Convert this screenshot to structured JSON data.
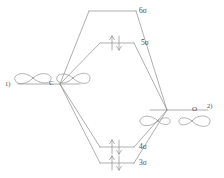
{
  "diagram": {
    "type": "molecular-orbital-correlation-diagram",
    "stroke_color": "#8c8c8c",
    "text_color": "#4a4a4a",
    "background_color": "#ffffff",
    "left_fragment": {
      "index_label": "1)",
      "atom_label": "C",
      "orbitals": [
        "p-orbital-lobe-outer",
        "p-orbital-lobe-inner"
      ]
    },
    "right_fragment": {
      "index_label": "2)",
      "atom_label": "O",
      "orbitals": [
        "p-orbital-lobe-inner",
        "p-orbital-lobe-outer"
      ]
    },
    "mo_levels": [
      {
        "label": "6σ",
        "electrons": 0,
        "occupancy": "empty"
      },
      {
        "label": "5σ",
        "electrons": 2,
        "occupancy": "paired"
      },
      {
        "label": "4σ",
        "electrons": 2,
        "occupancy": "paired"
      },
      {
        "label": "3σ",
        "electrons": 2,
        "occupancy": "paired"
      }
    ],
    "electron_arrows": {
      "up_arrow": "↑",
      "down_arrow": "↓"
    }
  }
}
